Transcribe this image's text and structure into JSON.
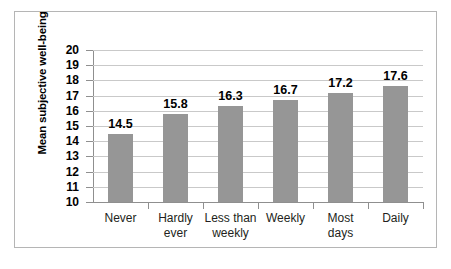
{
  "chart_data": {
    "type": "bar",
    "title": "",
    "subtitle": "",
    "xlabel": "",
    "ylabel": "Mean subjective well-being",
    "categories": [
      "Never",
      "Hardly ever",
      "Less than weekly",
      "Weekly",
      "Most days",
      "Daily"
    ],
    "category_lines": [
      [
        "Never"
      ],
      [
        "Hardly",
        "ever"
      ],
      [
        "Less than",
        "weekly"
      ],
      [
        "Weekly"
      ],
      [
        "Most",
        "days"
      ],
      [
        "Daily"
      ]
    ],
    "values": [
      14.5,
      15.8,
      16.3,
      16.7,
      17.2,
      17.6
    ],
    "value_labels": [
      "14.5",
      "15.8",
      "16.3",
      "16.7",
      "17.2",
      "17.6"
    ],
    "ylim": [
      10,
      20
    ],
    "ytick_step": 1,
    "ytick_labels": [
      "20",
      "19",
      "18",
      "17",
      "16",
      "15",
      "14",
      "13",
      "12",
      "11",
      "10"
    ],
    "ytick_values": [
      20,
      19,
      18,
      17,
      16,
      15,
      14,
      13,
      12,
      11,
      10
    ],
    "grid": true,
    "grid_axis": "y",
    "legend": false,
    "legend_position": "none",
    "series": [
      {
        "name": "Mean subjective well-being",
        "values": [
          14.5,
          15.8,
          16.3,
          16.7,
          17.2,
          17.6
        ]
      }
    ]
  },
  "style": {
    "bar_color": "#969696",
    "grid_color": "#c9c9c9",
    "axis_color": "#8f8f8f",
    "frame_color": "#b5b5b5",
    "text_color": "#000000",
    "background": "#ffffff"
  }
}
